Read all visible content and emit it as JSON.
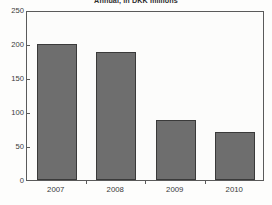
{
  "chart_data": {
    "type": "bar",
    "title": "",
    "subtitle": "Annual, in DKK millions",
    "xlabel": "",
    "ylabel": "",
    "categories": [
      "2007",
      "2008",
      "2009",
      "2010"
    ],
    "values": [
      200,
      188,
      88,
      70
    ],
    "ylim": [
      0,
      250
    ],
    "yticks": [
      "0",
      "50",
      "100",
      "150",
      "200",
      "250"
    ],
    "ytick_values": [
      0,
      50,
      100,
      150,
      200,
      250
    ],
    "grid": false,
    "legend": null,
    "bar_color": "#6e6e6e",
    "bar_edge_color": "#3a3a3a",
    "axis_color": "#5a5a5a",
    "background_color": "#fcfcfb"
  }
}
